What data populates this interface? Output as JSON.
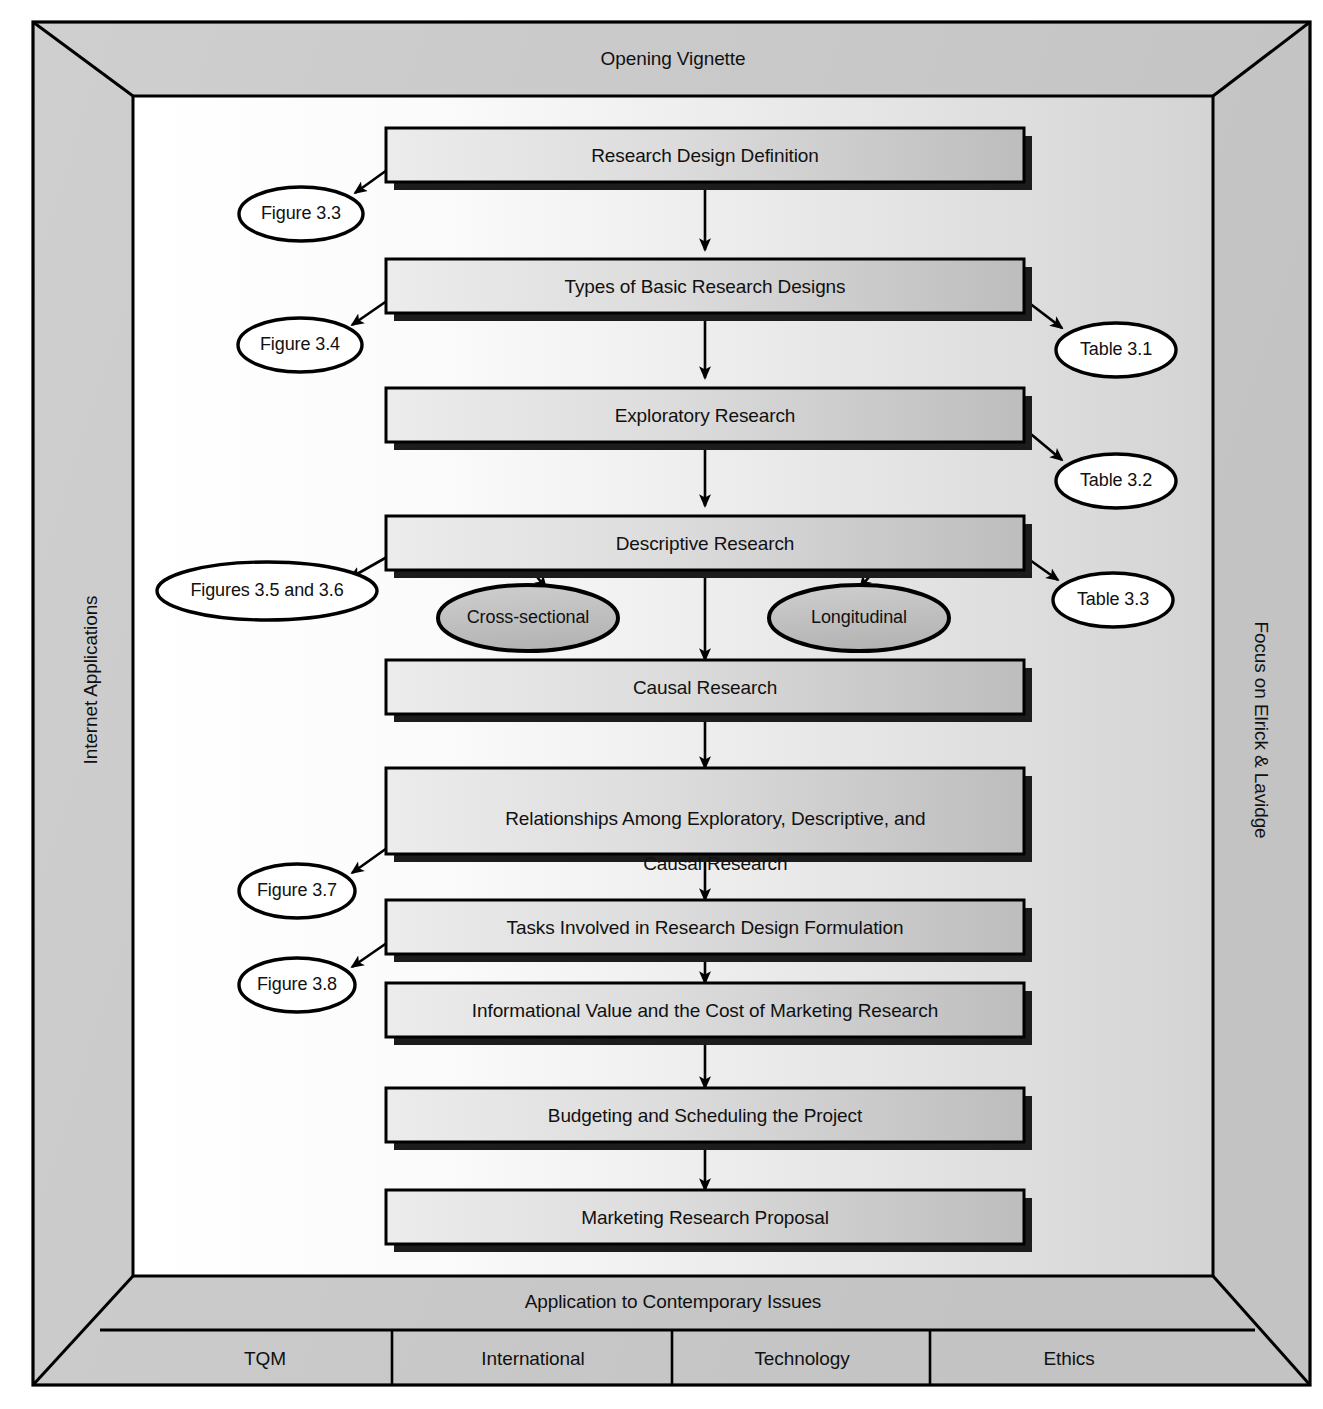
{
  "diagram": {
    "frame": {
      "top_label": "Opening Vignette",
      "bottom_label": "Application to Contemporary Issues",
      "left_label": "Internet Applications",
      "right_label": "Focus on Elrick & Lavidge"
    },
    "bottom_cells": [
      {
        "label": "TQM"
      },
      {
        "label": "International"
      },
      {
        "label": "Technology"
      },
      {
        "label": "Ethics"
      }
    ],
    "process_boxes": [
      {
        "id": "box1",
        "label": "Research Design Definition",
        "lines": [
          "Research Design Definition"
        ]
      },
      {
        "id": "box2",
        "label": "Types of Basic Research Designs",
        "lines": [
          "Types of Basic Research Designs"
        ]
      },
      {
        "id": "box3",
        "label": "Exploratory Research",
        "lines": [
          "Exploratory Research"
        ]
      },
      {
        "id": "box4",
        "label": "Descriptive Research",
        "lines": [
          "Descriptive Research"
        ]
      },
      {
        "id": "box5",
        "label": "Causal Research",
        "lines": [
          "Causal Research"
        ]
      },
      {
        "id": "box6",
        "label": "Relationships Among Exploratory, Descriptive, and Causal Research",
        "lines": [
          "Relationships Among Exploratory, Descriptive, and",
          "Causal Research"
        ]
      },
      {
        "id": "box7",
        "label": "Tasks Involved in Research Design Formulation",
        "lines": [
          "Tasks Involved in Research Design Formulation"
        ]
      },
      {
        "id": "box8",
        "label": "Informational Value and the Cost of Marketing Research",
        "lines": [
          "Informational Value and the Cost of Marketing Research"
        ]
      },
      {
        "id": "box9",
        "label": "Budgeting and Scheduling the Project",
        "lines": [
          "Budgeting and Scheduling the Project"
        ]
      },
      {
        "id": "box10",
        "label": "Marketing Research Proposal",
        "lines": [
          "Marketing Research Proposal"
        ]
      }
    ],
    "reference_ellipses": [
      {
        "id": "ref-figure-3-3",
        "label": "Figure 3.3",
        "fill": "white",
        "from": "box1"
      },
      {
        "id": "ref-figure-3-4",
        "label": "Figure 3.4",
        "fill": "white",
        "from": "box2"
      },
      {
        "id": "ref-table-3-1",
        "label": "Table 3.1",
        "fill": "white",
        "from": "box2"
      },
      {
        "id": "ref-table-3-2",
        "label": "Table 3.2",
        "fill": "white",
        "from": "box3"
      },
      {
        "id": "ref-figures-3-5-3-6",
        "label": "Figures 3.5 and 3.6",
        "fill": "white",
        "from": "box4"
      },
      {
        "id": "ref-table-3-3",
        "label": "Table 3.3",
        "fill": "white",
        "from": "box4"
      },
      {
        "id": "ref-figure-3-7",
        "label": "Figure 3.7",
        "fill": "white",
        "from": "box6"
      },
      {
        "id": "ref-figure-3-8",
        "label": "Figure 3.8",
        "fill": "white",
        "from": "box7"
      }
    ],
    "subtype_ellipses": [
      {
        "id": "sub-cross-sectional",
        "label": "Cross-sectional",
        "fill": "gray",
        "from": "box4"
      },
      {
        "id": "sub-longitudinal",
        "label": "Longitudinal",
        "fill": "gray",
        "from": "box4"
      }
    ],
    "colors": {
      "frame_fill": "#c8c8c8",
      "box_fill_light": "#e8e8e8",
      "box_fill_dark": "#bcbcbc",
      "ellipse_white": "#ffffff",
      "ellipse_gray": "#c0c0c0",
      "stroke": "#000000",
      "inner_bg_left": "#ffffff",
      "inner_bg_right": "#d6d6d6",
      "shadow": "#1a1a1a"
    }
  }
}
